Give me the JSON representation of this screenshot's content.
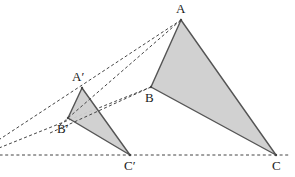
{
  "figure": {
    "type": "geometry-diagram",
    "width": 295,
    "height": 177,
    "background_color": "#ffffff"
  },
  "style": {
    "triangle_fill": "#cfcfcf",
    "triangle_stroke": "#555555",
    "triangle_stroke_width": 1.4,
    "dashed_stroke": "#444444",
    "dashed_stroke_width": 1,
    "dash_pattern": "3,2.4",
    "baseline_dash_pattern": "3,2.6",
    "label_color": "#1a1a1a",
    "label_font_size": 13
  },
  "triangles": [
    {
      "name": "triangle-abc",
      "id": "large",
      "vertices": [
        {
          "label": "A",
          "x": 181,
          "y": 20
        },
        {
          "label": "B",
          "x": 151,
          "y": 87
        },
        {
          "label": "C",
          "x": 276,
          "y": 155
        }
      ]
    },
    {
      "name": "triangle-a-prime-b-prime-c-prime",
      "id": "small",
      "vertices": [
        {
          "label": "A′",
          "x": 82,
          "y": 88
        },
        {
          "label": "B′",
          "x": 68,
          "y": 118
        },
        {
          "label": "C′",
          "x": 130,
          "y": 155
        }
      ]
    }
  ],
  "labels": [
    {
      "name": "label-a",
      "text": "A",
      "x": 176,
      "y": 2
    },
    {
      "name": "label-b",
      "text": "B",
      "x": 145,
      "y": 91
    },
    {
      "name": "label-c",
      "text": "C",
      "x": 272,
      "y": 159
    },
    {
      "name": "label-a-prime",
      "text": "A′",
      "x": 72,
      "y": 70
    },
    {
      "name": "label-b-prime",
      "text": "B′",
      "x": 57,
      "y": 122
    },
    {
      "name": "label-c-prime",
      "text": "C′",
      "x": 124,
      "y": 159
    }
  ],
  "dashed_rays": [
    {
      "name": "ray-center-to-a",
      "from_label": "center",
      "through_label": "A′",
      "to_label": "A",
      "x1": -6,
      "y1": 143,
      "x2": 181,
      "y2": 20
    },
    {
      "name": "ray-center-to-b",
      "from_label": "center",
      "through_label": "B′",
      "to_label": "B",
      "x1": -6,
      "y1": 150,
      "x2": 151,
      "y2": 87
    },
    {
      "name": "baseline-center-to-c",
      "from_label": "center",
      "through_label": "C′",
      "to_label": "C",
      "x1": -6,
      "y1": 155,
      "x2": 290,
      "y2": 155
    }
  ]
}
